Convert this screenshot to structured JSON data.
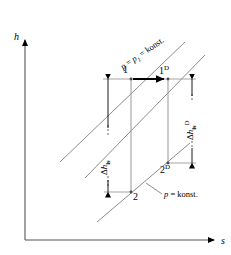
{
  "figure": {
    "type": "thermodynamic-enthalpy-entropy-diagram",
    "background_color": "#ffffff",
    "line_color": "#000000",
    "curve_color": "#8c8c8c",
    "axes": {
      "y_label": "h",
      "x_label": "s",
      "origin_px": [
        25,
        240
      ],
      "y_top_px": 38,
      "x_right_px": 218
    },
    "isobars": [
      {
        "id": "upper-isobar",
        "label": "p = p1 = konst.",
        "label_parts": {
          "p": "p",
          "eq1": " = ",
          "p1_base": "p",
          "p1_sub": "1",
          "eq2": " = konst."
        },
        "rotation_deg": -34
      },
      {
        "id": "lower-isobar",
        "label": "p = konst.",
        "label_parts": {
          "p": "p",
          "rest": " = konst."
        },
        "rotation_deg": 0
      }
    ],
    "points": [
      {
        "id": "point-1",
        "label": "1",
        "sup": "",
        "x_px": 131,
        "y_px": 79
      },
      {
        "id": "point-1D",
        "label": "1",
        "sup": "D",
        "x_px": 168,
        "y_px": 79
      },
      {
        "id": "point-2",
        "label": "2",
        "sup": "",
        "x_px": 131,
        "y_px": 192
      },
      {
        "id": "point-2D",
        "label": "2",
        "sup": "D",
        "x_px": 168,
        "y_px": 163
      }
    ],
    "dimensions": [
      {
        "id": "delta-h-is",
        "symbol": "Δ",
        "base": "h",
        "sub": "is",
        "sup": "",
        "x_px": 108,
        "top_px": 79,
        "bottom_px": 192
      },
      {
        "id": "delta-h-is-D",
        "symbol": "Δ",
        "base": "h",
        "sub": "is",
        "sup": "D",
        "x_px": 192,
        "top_px": 79,
        "bottom_px": 163
      }
    ],
    "process_arrow": {
      "id": "throttling-arrow",
      "from_px": [
        133,
        79
      ],
      "to_px": [
        166,
        79
      ]
    }
  }
}
